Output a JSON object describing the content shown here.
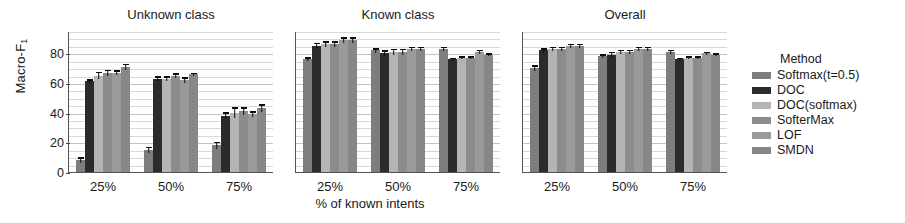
{
  "chart_data": {
    "type": "bar",
    "title": "",
    "xlabel": "% of known intents",
    "ylabel": "Macro-F",
    "ylabel_sub": "1",
    "ylim": [
      0,
      95
    ],
    "yticks": [
      0,
      20,
      40,
      60,
      80
    ],
    "ytick_labels": [
      "0",
      "20",
      "40",
      "60",
      "80"
    ],
    "grid": true,
    "grid_minor_step": 5,
    "legend_position": "right",
    "legend_title": "Method",
    "categories": [
      "25%",
      "50%",
      "75%"
    ],
    "panels": [
      {
        "title": "Unknown class",
        "series": [
          {
            "name": "Softmax(t=0.5)",
            "color": "#7d7d7d",
            "values": [
              8,
              15,
              18
            ],
            "errors": [
              4,
              4,
              5
            ]
          },
          {
            "name": "DOC",
            "color": "#2b2b2b",
            "values": [
              61,
              63,
              38
            ],
            "errors": [
              3,
              3,
              5
            ]
          },
          {
            "name": "DOC(softmax)",
            "color": "#b4b4b4",
            "values": [
              65,
              63,
              40
            ],
            "errors": [
              5,
              3,
              7
            ]
          },
          {
            "name": "SofterMax",
            "color": "#8c8c8c",
            "values": [
              67,
              65,
              41
            ],
            "errors": [
              4,
              3,
              5
            ]
          },
          {
            "name": "LOF",
            "color": "#9a9a9a",
            "values": [
              67,
              62,
              39
            ],
            "errors": [
              3,
              4,
              4
            ]
          },
          {
            "name": "SMDN",
            "color": "#878787",
            "values": [
              71,
              66,
              43
            ],
            "errors": [
              4,
              2,
              5
            ]
          }
        ]
      },
      {
        "title": "Known class",
        "series": [
          {
            "name": "Softmax(t=0.5)",
            "color": "#7d7d7d",
            "values": [
              76,
              82,
              83
            ],
            "errors": [
              3,
              3,
              3
            ]
          },
          {
            "name": "DOC",
            "color": "#2b2b2b",
            "values": [
              85,
              80,
              76
            ],
            "errors": [
              4,
              4,
              2
            ]
          },
          {
            "name": "DOC(softmax)",
            "color": "#b4b4b4",
            "values": [
              86,
              81,
              77
            ],
            "errors": [
              4,
              4,
              2
            ]
          },
          {
            "name": "SofterMax",
            "color": "#8c8c8c",
            "values": [
              86,
              81,
              77
            ],
            "errors": [
              4,
              4,
              2
            ]
          },
          {
            "name": "LOF",
            "color": "#9a9a9a",
            "values": [
              89,
              83,
              81
            ],
            "errors": [
              4,
              3,
              3
            ]
          },
          {
            "name": "SMDN",
            "color": "#878787",
            "values": [
              89,
              83,
              79
            ],
            "errors": [
              4,
              3,
              2
            ]
          }
        ]
      },
      {
        "title": "Overall",
        "series": [
          {
            "name": "Softmax(t=0.5)",
            "color": "#7d7d7d",
            "values": [
              70,
              78,
              81
            ],
            "errors": [
              4,
              3,
              3
            ]
          },
          {
            "name": "DOC",
            "color": "#2b2b2b",
            "values": [
              82,
              79,
              76
            ],
            "errors": [
              3,
              4,
              2
            ]
          },
          {
            "name": "DOC(softmax)",
            "color": "#b4b4b4",
            "values": [
              83,
              81,
              77
            ],
            "errors": [
              3,
              3,
              2
            ]
          },
          {
            "name": "SofterMax",
            "color": "#8c8c8c",
            "values": [
              83,
              81,
              77
            ],
            "errors": [
              3,
              3,
              2
            ]
          },
          {
            "name": "LOF",
            "color": "#9a9a9a",
            "values": [
              85,
              83,
              80
            ],
            "errors": [
              3,
              3,
              2
            ]
          },
          {
            "name": "SMDN",
            "color": "#878787",
            "values": [
              85,
              83,
              79
            ],
            "errors": [
              3,
              3,
              2
            ]
          }
        ]
      }
    ]
  },
  "legend": {
    "title": "Method",
    "items": [
      {
        "label": "Softmax(t=0.5)",
        "color": "#7d7d7d"
      },
      {
        "label": "DOC",
        "color": "#2b2b2b"
      },
      {
        "label": "DOC(softmax)",
        "color": "#b4b4b4"
      },
      {
        "label": "SofterMax",
        "color": "#8c8c8c"
      },
      {
        "label": "LOF",
        "color": "#9a9a9a"
      },
      {
        "label": "SMDN",
        "color": "#878787"
      }
    ]
  }
}
